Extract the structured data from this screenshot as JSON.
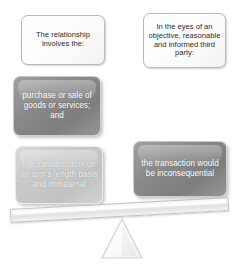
{
  "diagram": {
    "type": "seesaw-balance",
    "colors": {
      "box_white_fill": "#fdfdfd",
      "box_white_border": "#b9b9b9",
      "box_grey_dark": "#8b8b8b",
      "box_grey_light": "#c9c9c9",
      "text_dark": "#2b2b2b",
      "text_light": "#ffffff",
      "beam_fill": "#ededed",
      "beam_border": "#c4c4c4",
      "fulcrum_fill": "#fafafa",
      "fulcrum_border": "#cfcfcf"
    },
    "left_side": {
      "premise": "The relationship involves the:",
      "conditions": [
        "purchase or sale of goods or services; and",
        "the transaction is on an arm's length basis and immaterial"
      ]
    },
    "right_side": {
      "premise": "In the eyes of an objective, reasonable and informed third party:",
      "conditions": [
        "the transaction would be inconsequential"
      ]
    },
    "beam": {
      "tilt_degrees": -3.1,
      "label": "balance-beam"
    },
    "fulcrum": {
      "label": "fulcrum-triangle"
    }
  }
}
